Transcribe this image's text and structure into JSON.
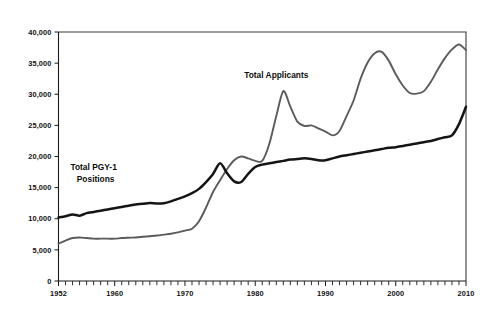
{
  "figure": {
    "background_color": "#ffffff",
    "plot_frame_color": "#3a3a3a"
  },
  "chart_data": {
    "type": "line",
    "title": "",
    "subtitle": "",
    "xlabel": "",
    "ylabel": "",
    "xlim": [
      1952,
      2010
    ],
    "ylim": [
      0,
      40000
    ],
    "grid": false,
    "legend_position": "inline-annotations",
    "ytick_labels": [
      "0",
      "5,000",
      "10,000",
      "15,000",
      "20,000",
      "25,000",
      "30,000",
      "35,000",
      "40,000"
    ],
    "ytick_values": [
      0,
      5000,
      10000,
      15000,
      20000,
      25000,
      30000,
      35000,
      40000
    ],
    "xtick_labels": [
      "1952",
      "1960",
      "1970",
      "1980",
      "1990",
      "2000",
      "2010"
    ],
    "xtick_values": [
      1952,
      1960,
      1970,
      1980,
      1990,
      2000,
      2010
    ],
    "xtick_minor_interval": 1,
    "annotations": [
      {
        "name": "applicants-label",
        "text": "Total Applicants",
        "x": 1983,
        "y": 32600,
        "color": "#0d0d0d"
      },
      {
        "name": "positions-label",
        "text": "Total PGY-1",
        "text2": "Positions",
        "x": 1957,
        "y": 17800,
        "color": "#0d0d0d"
      }
    ],
    "x": [
      1952,
      1953,
      1954,
      1955,
      1956,
      1957,
      1958,
      1959,
      1960,
      1961,
      1962,
      1963,
      1964,
      1965,
      1966,
      1967,
      1968,
      1969,
      1970,
      1971,
      1972,
      1973,
      1974,
      1975,
      1976,
      1977,
      1978,
      1979,
      1980,
      1981,
      1982,
      1983,
      1984,
      1985,
      1986,
      1987,
      1988,
      1989,
      1990,
      1991,
      1992,
      1993,
      1994,
      1995,
      1996,
      1997,
      1998,
      1999,
      2000,
      2001,
      2002,
      2003,
      2004,
      2005,
      2006,
      2007,
      2008,
      2009,
      2010
    ],
    "series": [
      {
        "name": "Total Applicants",
        "color": "#5b5b5b",
        "line_width": 1.9,
        "values": [
          6000,
          6500,
          6900,
          7000,
          6900,
          6800,
          6800,
          6800,
          6800,
          6900,
          6950,
          7000,
          7100,
          7200,
          7300,
          7450,
          7600,
          7800,
          8100,
          8400,
          9600,
          11800,
          14300,
          16200,
          18000,
          19400,
          20000,
          19700,
          19300,
          19300,
          22000,
          26500,
          30500,
          28000,
          25600,
          24900,
          25000,
          24500,
          24000,
          23400,
          24100,
          26500,
          29000,
          32500,
          35100,
          36600,
          36800,
          35400,
          33200,
          31400,
          30200,
          30100,
          30500,
          32000,
          34000,
          35800,
          37200,
          38000,
          37100
        ]
      },
      {
        "name": "Total PGY-1 Positions",
        "color": "#141414",
        "line_width": 2.5,
        "values": [
          10200,
          10400,
          10700,
          10500,
          10900,
          11100,
          11300,
          11500,
          11700,
          11900,
          12100,
          12300,
          12400,
          12550,
          12450,
          12500,
          12800,
          13200,
          13600,
          14100,
          14800,
          15900,
          17200,
          18900,
          17300,
          16000,
          15900,
          17200,
          18300,
          18700,
          18900,
          19100,
          19300,
          19500,
          19600,
          19700,
          19600,
          19400,
          19400,
          19700,
          20000,
          20200,
          20400,
          20600,
          20800,
          21000,
          21200,
          21400,
          21500,
          21700,
          21900,
          22100,
          22300,
          22500,
          22800,
          23100,
          23400,
          25200,
          28000
        ]
      }
    ]
  }
}
